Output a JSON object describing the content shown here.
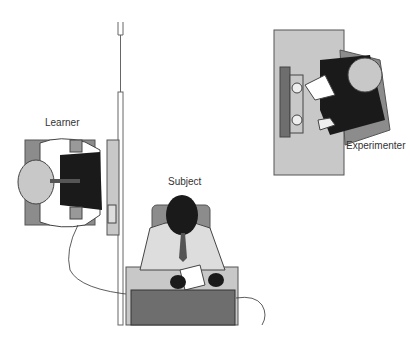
{
  "figure": {
    "type": "illustration",
    "subject_matter": "obedience experiment room layout, top view",
    "labels": {
      "learner": "Learner",
      "subject": "Subject",
      "experimenter": "Experimenter"
    },
    "colors": {
      "light_gray": "#c8c8c8",
      "mid_gray": "#8c8c8c",
      "dark_gray": "#6e6e6e",
      "black": "#1a1a1a",
      "line": "#555555"
    }
  }
}
